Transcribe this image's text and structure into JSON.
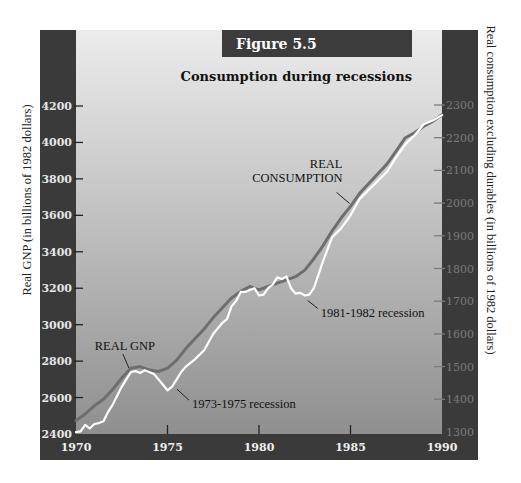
{
  "chart_data": {
    "type": "line",
    "figure_label": "Figure 5.5",
    "title": "Consumption during recessions",
    "xlabel": "",
    "ylabel_left": "Real GNP (in billions of 1982 dollars)",
    "ylabel_right": "Real consumption excluding durables (in billions of 1982 dollars)",
    "xlim": [
      1970,
      1990
    ],
    "ylim_left": [
      2400,
      4200
    ],
    "ylim_right": [
      1300,
      2300
    ],
    "x_ticks": [
      "1970",
      "1975",
      "1980",
      "1985",
      "1990"
    ],
    "y_ticks_left": [
      "2400",
      "2600",
      "2800",
      "3000",
      "3200",
      "3400",
      "3600",
      "3800",
      "4000",
      "4200"
    ],
    "y_ticks_right": [
      "1300",
      "1400",
      "1500",
      "1600",
      "1700",
      "1800",
      "1900",
      "2000",
      "2100",
      "2200",
      "2300"
    ],
    "grid": false,
    "series": [
      {
        "name": "REAL GNP",
        "axis": "left",
        "color": "#ffffff",
        "x": [
          1970,
          1970.25,
          1970.5,
          1970.75,
          1971,
          1971.25,
          1971.5,
          1971.75,
          1972,
          1972.25,
          1972.5,
          1972.75,
          1973,
          1973.25,
          1973.5,
          1973.75,
          1974,
          1974.25,
          1974.5,
          1974.75,
          1975,
          1975.25,
          1975.5,
          1975.75,
          1976,
          1976.5,
          1977,
          1977.5,
          1978,
          1978.25,
          1978.5,
          1978.75,
          1979,
          1979.25,
          1979.5,
          1979.75,
          1980,
          1980.25,
          1980.5,
          1980.75,
          1981,
          1981.25,
          1981.5,
          1981.75,
          1982,
          1982.25,
          1982.5,
          1982.75,
          1983,
          1983.5,
          1984,
          1984.5,
          1985,
          1985.5,
          1986,
          1986.5,
          1987,
          1987.5,
          1988,
          1988.5,
          1989,
          1989.5,
          1990
        ],
        "values": [
          2410,
          2415,
          2450,
          2430,
          2455,
          2460,
          2470,
          2520,
          2560,
          2610,
          2660,
          2700,
          2740,
          2745,
          2735,
          2750,
          2740,
          2730,
          2700,
          2670,
          2640,
          2660,
          2700,
          2740,
          2770,
          2810,
          2860,
          2950,
          3010,
          3030,
          3100,
          3130,
          3180,
          3180,
          3190,
          3200,
          3160,
          3165,
          3200,
          3220,
          3260,
          3250,
          3265,
          3200,
          3170,
          3175,
          3160,
          3165,
          3200,
          3350,
          3480,
          3530,
          3600,
          3690,
          3740,
          3790,
          3840,
          3920,
          3990,
          4040,
          4100,
          4120,
          4150
        ]
      },
      {
        "name": "REAL CONSUMPTION",
        "axis": "right",
        "color": "#6e6e6e",
        "x": [
          1970,
          1970.5,
          1971,
          1971.5,
          1972,
          1972.5,
          1973,
          1973.5,
          1974,
          1974.5,
          1975,
          1975.5,
          1976,
          1976.5,
          1977,
          1977.5,
          1978,
          1978.5,
          1979,
          1979.5,
          1980,
          1980.5,
          1981,
          1981.5,
          1982,
          1982.5,
          1983,
          1983.5,
          1984,
          1984.5,
          1985,
          1985.5,
          1986,
          1986.5,
          1987,
          1987.5,
          1988,
          1988.5,
          1989,
          1989.5,
          1990
        ],
        "values": [
          1335,
          1355,
          1380,
          1400,
          1430,
          1465,
          1495,
          1500,
          1490,
          1485,
          1495,
          1520,
          1555,
          1585,
          1615,
          1650,
          1680,
          1710,
          1730,
          1745,
          1735,
          1745,
          1755,
          1765,
          1775,
          1795,
          1830,
          1870,
          1915,
          1955,
          1990,
          2030,
          2060,
          2090,
          2120,
          2160,
          2200,
          2215,
          2235,
          2250,
          2270
        ]
      }
    ],
    "annotations": [
      {
        "text": "REAL GNP",
        "target_series": "REAL GNP",
        "at_x": 1973.0
      },
      {
        "text": "REAL",
        "text2": "CONSUMPTION",
        "target_series": "REAL CONSUMPTION",
        "at_x": 1985.0
      },
      {
        "text": "1973-1975 recession",
        "target_series": "REAL GNP",
        "at_x": 1975.3
      },
      {
        "text": "1981-1982 recession",
        "target_series": "REAL GNP",
        "at_x": 1982.5
      }
    ]
  },
  "colors": {
    "axis_bar": "#3a3a3a",
    "banner": "#3c3c3c",
    "plot_top": "#ececec",
    "plot_bottom": "#8f8f8f"
  }
}
